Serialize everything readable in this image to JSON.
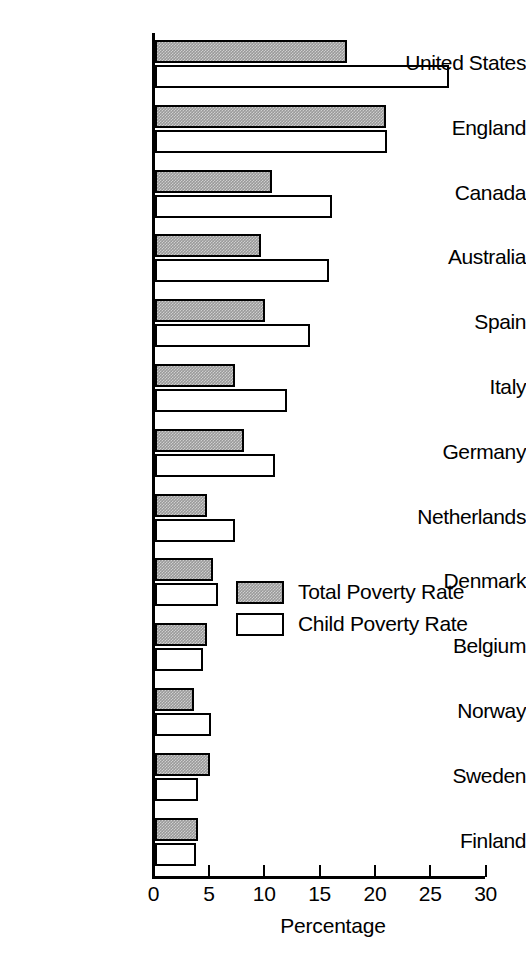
{
  "chart_data": {
    "type": "bar",
    "orientation": "horizontal",
    "title": "",
    "xlabel": "Percentage",
    "ylabel": "",
    "xlim": [
      0,
      30
    ],
    "xticks": [
      0,
      5,
      10,
      15,
      20,
      25,
      30
    ],
    "xtick_labels": [
      "0",
      "5",
      "10",
      "15",
      "20",
      "25",
      "30"
    ],
    "grid": false,
    "legend_position": "center-right",
    "categories": [
      "United States",
      "England",
      "Canada",
      "Australia",
      "Spain",
      "Italy",
      "Germany",
      "Netherlands",
      "Denmark",
      "Belgium",
      "Norway",
      "Sweden",
      "Finland"
    ],
    "series": [
      {
        "name": "Total Poverty Rate",
        "fill": "gray-hatch",
        "color": "#9a9a9a",
        "values": [
          17.3,
          20.9,
          10.6,
          9.6,
          9.9,
          7.2,
          8.0,
          4.7,
          5.2,
          4.7,
          3.5,
          5.0,
          3.9
        ]
      },
      {
        "name": "Child Poverty Rate",
        "fill": "white",
        "color": "#ffffff",
        "values": [
          26.6,
          21.0,
          16.0,
          15.7,
          14.0,
          11.9,
          10.8,
          7.2,
          5.7,
          4.3,
          5.1,
          3.9,
          3.7
        ]
      }
    ]
  },
  "legend": {
    "entries": [
      {
        "label": "Total Poverty Rate",
        "swatch": "gray-hatch"
      },
      {
        "label": "Child Poverty Rate",
        "swatch": "white"
      }
    ]
  }
}
